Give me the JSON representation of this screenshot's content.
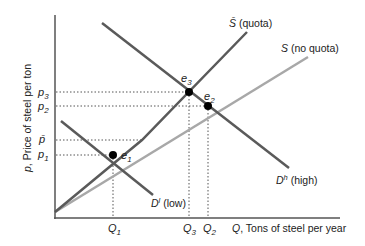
{
  "diagram": {
    "axes": {
      "y_label_var": "p",
      "y_label": ", Price of steel per ton",
      "x_label_var": "Q",
      "x_label": ", Tons of steel per year"
    },
    "price_ticks": [
      {
        "sym": "p",
        "sub": "3"
      },
      {
        "sym": "p",
        "sub": "2"
      },
      {
        "sym": "p̄",
        "sub": ""
      },
      {
        "sym": "p",
        "sub": "1"
      }
    ],
    "quantity_ticks": [
      {
        "sym": "Q",
        "sub": "1"
      },
      {
        "sym": "Q",
        "sub": "3"
      },
      {
        "sym": "Q",
        "sub": "2"
      }
    ],
    "curves": {
      "supply_quota": {
        "sym": "S̄",
        "label": " (quota)",
        "color": "#5a5a5a"
      },
      "supply_no_quota": {
        "sym": "S",
        "label": " (no quota)",
        "color": "#a8a8a8"
      },
      "demand_high": {
        "sym": "D",
        "sup": "h",
        "label": " (high)",
        "color": "#5a5a5a"
      },
      "demand_low": {
        "sym": "D",
        "sup": "l",
        "label": " (low)",
        "color": "#5a5a5a"
      }
    },
    "equilibria": [
      {
        "sym": "e",
        "sub": "1"
      },
      {
        "sym": "e",
        "sub": "2"
      },
      {
        "sym": "e",
        "sub": "3"
      }
    ]
  }
}
